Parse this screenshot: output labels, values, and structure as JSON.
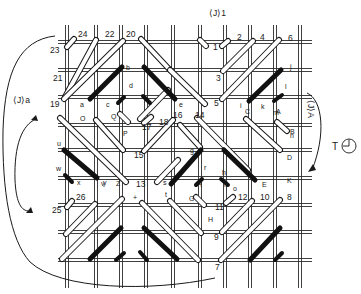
{
  "diagram": {
    "title_labels": {
      "top": "⟨J⟩1",
      "left": "⟨J⟩a",
      "right": "⟨J⟩A",
      "clock_prefix": "T"
    },
    "grid": {
      "vertical_x": [
        67,
        96,
        121,
        146,
        173,
        200,
        225,
        250,
        275,
        300
      ],
      "horizontal_y": [
        42,
        70,
        97,
        125,
        150,
        178,
        205,
        232,
        260
      ],
      "x_range": [
        58,
        312
      ],
      "y_range": [
        25,
        288
      ],
      "double_gap": 3
    },
    "open_stitches": [
      {
        "x1": 67,
        "y1": 47,
        "x2": 74,
        "y2": 39
      },
      {
        "x1": 65,
        "y1": 97,
        "x2": 96,
        "y2": 40
      },
      {
        "x1": 64,
        "y1": 99,
        "x2": 123,
        "y2": 41
      },
      {
        "x1": 141,
        "y1": 39,
        "x2": 170,
        "y2": 70
      },
      {
        "x1": 200,
        "y1": 40,
        "x2": 206,
        "y2": 46
      },
      {
        "x1": 222,
        "y1": 46,
        "x2": 228,
        "y2": 41
      },
      {
        "x1": 223,
        "y1": 71,
        "x2": 253,
        "y2": 41
      },
      {
        "x1": 222,
        "y1": 99,
        "x2": 279,
        "y2": 40
      },
      {
        "x1": 170,
        "y1": 70,
        "x2": 205,
        "y2": 104
      },
      {
        "x1": 60,
        "y1": 118,
        "x2": 126,
        "y2": 182
      },
      {
        "x1": 96,
        "y1": 120,
        "x2": 123,
        "y2": 150
      },
      {
        "x1": 120,
        "y1": 114,
        "x2": 128,
        "y2": 122
      },
      {
        "x1": 144,
        "y1": 123,
        "x2": 151,
        "y2": 117
      },
      {
        "x1": 140,
        "y1": 119,
        "x2": 168,
        "y2": 90
      },
      {
        "x1": 144,
        "y1": 151,
        "x2": 173,
        "y2": 120
      },
      {
        "x1": 157,
        "y1": 182,
        "x2": 178,
        "y2": 160
      },
      {
        "x1": 197,
        "y1": 118,
        "x2": 248,
        "y2": 170
      },
      {
        "x1": 200,
        "y1": 147,
        "x2": 180,
        "y2": 125
      },
      {
        "x1": 246,
        "y1": 119,
        "x2": 280,
        "y2": 150
      },
      {
        "x1": 277,
        "y1": 122,
        "x2": 287,
        "y2": 131
      },
      {
        "x1": 67,
        "y1": 207,
        "x2": 72,
        "y2": 201
      },
      {
        "x1": 66,
        "y1": 234,
        "x2": 95,
        "y2": 204
      },
      {
        "x1": 62,
        "y1": 259,
        "x2": 122,
        "y2": 199
      },
      {
        "x1": 142,
        "y1": 203,
        "x2": 198,
        "y2": 260
      },
      {
        "x1": 170,
        "y1": 201,
        "x2": 201,
        "y2": 233
      },
      {
        "x1": 196,
        "y1": 197,
        "x2": 204,
        "y2": 205
      },
      {
        "x1": 226,
        "y1": 203,
        "x2": 233,
        "y2": 197
      },
      {
        "x1": 222,
        "y1": 232,
        "x2": 252,
        "y2": 201
      },
      {
        "x1": 221,
        "y1": 260,
        "x2": 280,
        "y2": 200
      }
    ],
    "filled_stitches": [
      {
        "x1": 90,
        "y1": 99,
        "x2": 122,
        "y2": 67,
        "w": 5
      },
      {
        "x1": 144,
        "y1": 67,
        "x2": 175,
        "y2": 99,
        "w": 5
      },
      {
        "x1": 118,
        "y1": 103,
        "x2": 124,
        "y2": 97,
        "w": 4
      },
      {
        "x1": 143,
        "y1": 96,
        "x2": 150,
        "y2": 103,
        "w": 4
      },
      {
        "x1": 249,
        "y1": 101,
        "x2": 281,
        "y2": 70,
        "w": 5
      },
      {
        "x1": 274,
        "y1": 101,
        "x2": 282,
        "y2": 95,
        "w": 4
      },
      {
        "x1": 64,
        "y1": 150,
        "x2": 97,
        "y2": 178,
        "w": 5
      },
      {
        "x1": 65,
        "y1": 175,
        "x2": 72,
        "y2": 182,
        "w": 4
      },
      {
        "x1": 171,
        "y1": 184,
        "x2": 201,
        "y2": 150,
        "w": 5
      },
      {
        "x1": 224,
        "y1": 150,
        "x2": 255,
        "y2": 180,
        "w": 5
      },
      {
        "x1": 196,
        "y1": 185,
        "x2": 202,
        "y2": 179,
        "w": 4
      },
      {
        "x1": 221,
        "y1": 179,
        "x2": 228,
        "y2": 185,
        "w": 4
      },
      {
        "x1": 90,
        "y1": 259,
        "x2": 121,
        "y2": 228,
        "w": 5
      },
      {
        "x1": 144,
        "y1": 228,
        "x2": 177,
        "y2": 259,
        "w": 5
      },
      {
        "x1": 116,
        "y1": 260,
        "x2": 124,
        "y2": 253,
        "w": 4
      },
      {
        "x1": 140,
        "y1": 252,
        "x2": 147,
        "y2": 260,
        "w": 4
      },
      {
        "x1": 250,
        "y1": 260,
        "x2": 280,
        "y2": 228,
        "w": 5
      },
      {
        "x1": 275,
        "y1": 260,
        "x2": 282,
        "y2": 253,
        "w": 4
      }
    ],
    "number_labels": [
      {
        "text": "24",
        "x": 78,
        "y": 37
      },
      {
        "text": "22",
        "x": 105,
        "y": 37
      },
      {
        "text": "20",
        "x": 126,
        "y": 37
      },
      {
        "text": "23",
        "x": 50,
        "y": 53
      },
      {
        "text": "21",
        "x": 53,
        "y": 81
      },
      {
        "text": "19",
        "x": 50,
        "y": 107
      },
      {
        "text": "2",
        "x": 237,
        "y": 40
      },
      {
        "text": "4",
        "x": 260,
        "y": 40
      },
      {
        "text": "6",
        "x": 288,
        "y": 41
      },
      {
        "text": "1",
        "x": 213,
        "y": 50
      },
      {
        "text": "3",
        "x": 216,
        "y": 81
      },
      {
        "text": "5",
        "x": 214,
        "y": 106
      },
      {
        "text": "18",
        "x": 159,
        "y": 125
      },
      {
        "text": "17",
        "x": 142,
        "y": 130
      },
      {
        "text": "16",
        "x": 173,
        "y": 118
      },
      {
        "text": "14",
        "x": 195,
        "y": 118
      },
      {
        "text": "15",
        "x": 134,
        "y": 158
      },
      {
        "text": "13",
        "x": 136,
        "y": 187
      },
      {
        "text": "26",
        "x": 76,
        "y": 200
      },
      {
        "text": "25",
        "x": 52,
        "y": 213
      },
      {
        "text": "12",
        "x": 238,
        "y": 200
      },
      {
        "text": "10",
        "x": 260,
        "y": 200
      },
      {
        "text": "8",
        "x": 287,
        "y": 200
      },
      {
        "text": "11",
        "x": 215,
        "y": 210
      },
      {
        "text": "9",
        "x": 214,
        "y": 240
      },
      {
        "text": "7",
        "x": 215,
        "y": 270
      }
    ],
    "letter_labels": [
      {
        "text": "a",
        "x": 80,
        "y": 107
      },
      {
        "text": "b",
        "x": 126,
        "y": 70
      },
      {
        "text": "c",
        "x": 106,
        "y": 107
      },
      {
        "text": "d",
        "x": 129,
        "y": 88
      },
      {
        "text": "e",
        "x": 179,
        "y": 107
      },
      {
        "text": "f",
        "x": 222,
        "y": 152
      },
      {
        "text": "g",
        "x": 190,
        "y": 153
      },
      {
        "text": "h",
        "x": 222,
        "y": 175
      },
      {
        "text": "i",
        "x": 240,
        "y": 108
      },
      {
        "text": "j",
        "x": 290,
        "y": 69
      },
      {
        "text": "k",
        "x": 261,
        "y": 109
      },
      {
        "text": "l",
        "x": 285,
        "y": 89
      },
      {
        "text": "m",
        "x": 273,
        "y": 115
      },
      {
        "text": "n",
        "x": 290,
        "y": 138
      },
      {
        "text": "o",
        "x": 233,
        "y": 191
      },
      {
        "text": "p",
        "x": 224,
        "y": 185
      },
      {
        "text": "q",
        "x": 198,
        "y": 185
      },
      {
        "text": "r",
        "x": 204,
        "y": 170
      },
      {
        "text": "s",
        "x": 163,
        "y": 185
      },
      {
        "text": "t",
        "x": 165,
        "y": 197
      },
      {
        "text": "u",
        "x": 57,
        "y": 146
      },
      {
        "text": "v",
        "x": 101,
        "y": 186
      },
      {
        "text": "w",
        "x": 56,
        "y": 171
      },
      {
        "text": "x",
        "x": 77,
        "y": 185
      },
      {
        "text": "y",
        "x": 103,
        "y": 185
      },
      {
        "text": "A",
        "x": 276,
        "y": 114
      },
      {
        "text": "B",
        "x": 290,
        "y": 134
      },
      {
        "text": "C",
        "x": 245,
        "y": 114
      },
      {
        "text": "D",
        "x": 287,
        "y": 160
      },
      {
        "text": "E",
        "x": 262,
        "y": 187
      },
      {
        "text": "K",
        "x": 287,
        "y": 183
      },
      {
        "text": "O",
        "x": 80,
        "y": 121
      },
      {
        "text": "Q",
        "x": 111,
        "y": 119
      },
      {
        "text": "P",
        "x": 123,
        "y": 136
      },
      {
        "text": "Z",
        "x": 116,
        "y": 186
      },
      {
        "text": "+",
        "x": 133,
        "y": 200
      },
      {
        "text": "G",
        "x": 189,
        "y": 201
      },
      {
        "text": "H",
        "x": 208,
        "y": 222
      }
    ]
  }
}
